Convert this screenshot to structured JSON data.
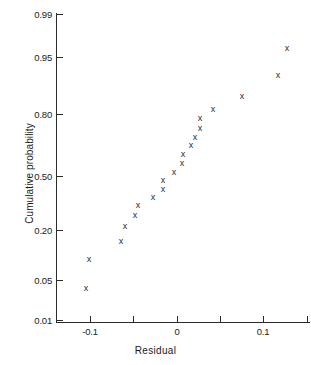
{
  "chart_data": {
    "type": "scatter",
    "title": "",
    "subtitle": "",
    "xlabel": "Residual",
    "ylabel": "Cumulative probability",
    "grid": false,
    "legend": null,
    "yscale": "normal-probability",
    "xlim": [
      -0.14,
      0.155
    ],
    "ylim": [
      0.01,
      0.99
    ],
    "xticks": [
      -0.1,
      0.1
    ],
    "xtick_labels": [
      "-0.1",
      "0",
      "0.1"
    ],
    "xtick_values": [
      -0.1,
      0.0,
      0.1
    ],
    "xminor_ticks": [
      -0.05,
      0.05,
      0.15
    ],
    "yticks": [
      0.01,
      0.05,
      0.2,
      0.5,
      0.8,
      0.95,
      0.99
    ],
    "ytick_labels": [
      "0.01",
      "0.05",
      "0.20",
      "0.50",
      "0.80",
      "0.95",
      "0.99"
    ],
    "marker": "x",
    "marker_glyph": "x",
    "marker_color": "#2b2b2b",
    "series": [
      {
        "name": "residuals",
        "x": [
          -0.103,
          -0.1,
          -0.062,
          -0.052,
          -0.045,
          -0.038,
          -0.028,
          -0.016,
          -0.016,
          -0.007,
          -0.001,
          0.001,
          0.008,
          0.013,
          0.019,
          0.023,
          0.026,
          0.046,
          0.074,
          0.117,
          0.128
        ],
        "y": [
          0.03,
          0.072,
          0.148,
          0.19,
          0.219,
          0.248,
          0.295,
          0.347,
          0.385,
          0.45,
          0.485,
          0.498,
          0.53,
          0.56,
          0.6,
          0.64,
          0.69,
          0.76,
          0.84,
          0.91,
          0.945
        ]
      }
    ],
    "points_px": [
      {
        "x": 86,
        "y": 288
      },
      {
        "x": 89,
        "y": 259
      },
      {
        "x": 121,
        "y": 241
      },
      {
        "x": 125,
        "y": 226
      },
      {
        "x": 135,
        "y": 215
      },
      {
        "x": 138,
        "y": 205
      },
      {
        "x": 153,
        "y": 197
      },
      {
        "x": 163,
        "y": 189
      },
      {
        "x": 163,
        "y": 180
      },
      {
        "x": 174,
        "y": 172
      },
      {
        "x": 182,
        "y": 163
      },
      {
        "x": 183,
        "y": 154
      },
      {
        "x": 191,
        "y": 145
      },
      {
        "x": 195,
        "y": 137
      },
      {
        "x": 200,
        "y": 128
      },
      {
        "x": 200,
        "y": 118
      },
      {
        "x": 213,
        "y": 109
      },
      {
        "x": 242,
        "y": 96
      },
      {
        "x": 278,
        "y": 75
      },
      {
        "x": 287,
        "y": 48
      }
    ],
    "ytick_px": [
      {
        "label": "0.99",
        "y": 14
      },
      {
        "label": "0.95",
        "y": 57
      },
      {
        "label": "0.80",
        "y": 114
      },
      {
        "label": "0.50",
        "y": 176
      },
      {
        "label": "0.20",
        "y": 230
      },
      {
        "label": "0.05",
        "y": 280
      },
      {
        "label": "0.01",
        "y": 320
      }
    ],
    "xtick_px": [
      {
        "label": "",
        "x": 90
      },
      {
        "label": "",
        "x": 133
      },
      {
        "label": "",
        "x": 177
      },
      {
        "label": "",
        "x": 220
      },
      {
        "label": "",
        "x": 263
      },
      {
        "label": "",
        "x": 307
      }
    ],
    "xlabel_px": [
      {
        "label": "-0.1",
        "x": 90
      },
      {
        "label": "0",
        "x": 177
      },
      {
        "label": "0.1",
        "x": 263
      }
    ]
  }
}
